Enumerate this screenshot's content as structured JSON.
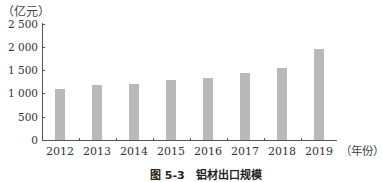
{
  "chart_data": {
    "type": "bar",
    "title": "",
    "caption": "图 5-3　铝材出口规模",
    "xlabel": "（年份）",
    "ylabel": "（亿元）",
    "categories": [
      "2012",
      "2013",
      "2014",
      "2015",
      "2016",
      "2017",
      "2018",
      "2019"
    ],
    "values": [
      1100,
      1190,
      1210,
      1300,
      1340,
      1450,
      1560,
      1970
    ],
    "ylim": [
      0,
      2500
    ],
    "yticks": [
      0,
      500,
      1000,
      1500,
      2000,
      2500
    ],
    "ytick_labels": [
      "0",
      "500",
      "1 000",
      "1 500",
      "2 000",
      "2 500"
    ],
    "grid": false,
    "legend": null,
    "bar_color": "#b9b9b9"
  },
  "labels": {
    "y_unit": "（亿元）",
    "x_unit": "（年份）",
    "caption": "图 5-3　铝材出口规模",
    "yticks": [
      "2 500",
      "2 000",
      "1 500",
      "1 000",
      "500",
      "0"
    ],
    "xticks": [
      "2012",
      "2013",
      "2014",
      "2015",
      "2016",
      "2017",
      "2018",
      "2019"
    ]
  }
}
